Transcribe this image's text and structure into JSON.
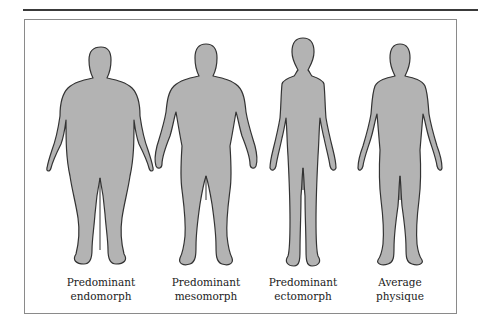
{
  "figure": {
    "colors": {
      "silhouette_fill": "#b3b3b3",
      "silhouette_stroke": "#333333",
      "frame_border": "#8a8a8a",
      "top_rule": "#3a3a3a"
    },
    "bodies": [
      {
        "id": "endomorph",
        "line1": "Predominant",
        "line2": "endomorph"
      },
      {
        "id": "mesomorph",
        "line1": "Predominant",
        "line2": "mesomorph"
      },
      {
        "id": "ectomorph",
        "line1": "Predominant",
        "line2": "ectomorph"
      },
      {
        "id": "average",
        "line1": "Average",
        "line2": "physique"
      }
    ]
  }
}
